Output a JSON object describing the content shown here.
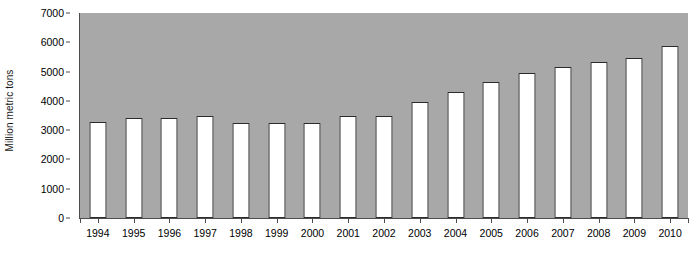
{
  "chart_data": {
    "type": "bar",
    "title": "",
    "xlabel": "",
    "ylabel": "Million metric tons",
    "ylim": [
      0,
      7000
    ],
    "ytick_step": 1000,
    "yticks": [
      "0",
      "1000",
      "2000",
      "3000",
      "4000",
      "5000",
      "6000",
      "7000"
    ],
    "grid": false,
    "legend": null,
    "plot_background_color": "#a8a8a8",
    "bar_fill_color": "#ffffff",
    "bar_edge_color": "#2b2b2b",
    "categories": [
      "1994",
      "1995",
      "1996",
      "1997",
      "1998",
      "1999",
      "2000",
      "2001",
      "2002",
      "2003",
      "2004",
      "2005",
      "2006",
      "2007",
      "2008",
      "2009",
      "2010"
    ],
    "values": [
      3280,
      3400,
      3430,
      3470,
      3230,
      3230,
      3230,
      3480,
      3500,
      3950,
      4300,
      4650,
      4950,
      5150,
      5320,
      5480,
      5870
    ]
  }
}
